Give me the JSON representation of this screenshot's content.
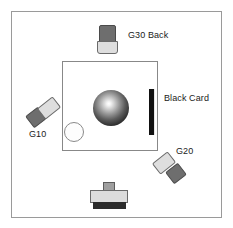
{
  "diagram": {
    "background_color": "#ffffff",
    "boundary": {
      "name": "room-boundary",
      "border_color": "#9a9a9a"
    },
    "table_area": {
      "name": "table-area",
      "border_color": "#888888"
    },
    "subject": {
      "sphere_label": "",
      "highlight_position": "upper-left",
      "color_dark": "#141414",
      "color_highlight": "#ffffff"
    },
    "reference_circle": {
      "fill": "#fdfdfd",
      "stroke": "#8a8a8a"
    },
    "black_card": {
      "label": "Black Card",
      "color": "#111111"
    },
    "lights": [
      {
        "id": "g30",
        "label": "G30 Back",
        "position": "top-center",
        "head_color": "#6e6e6e",
        "body_color": "#dedede"
      },
      {
        "id": "g10",
        "label": "G10",
        "position": "left",
        "head_color": "#6e6e6e",
        "body_color": "#dedede"
      },
      {
        "id": "g20",
        "label": "G20",
        "position": "bottom-right",
        "head_color": "#6e6e6e",
        "body_color": "#dedede"
      }
    ],
    "camera": {
      "label": "",
      "position": "bottom-center",
      "body_color": "#dcdcdc",
      "base_color": "#2b2b2b",
      "lens_color": "#9f9f9f"
    }
  }
}
